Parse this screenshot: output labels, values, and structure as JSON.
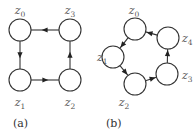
{
  "diagrams": [
    {
      "caption": "(a)",
      "nodes": [
        {
          "id": "z0",
          "base": "z",
          "sub": "0",
          "cx": 20,
          "cy": 30,
          "lx": 20,
          "ly": 14,
          "anchor": "middle"
        },
        {
          "id": "z1",
          "base": "z",
          "sub": "1",
          "cx": 20,
          "cy": 80,
          "lx": 20,
          "ly": 106,
          "anchor": "middle"
        },
        {
          "id": "z2",
          "base": "z",
          "sub": "2",
          "cx": 70,
          "cy": 80,
          "lx": 70,
          "ly": 106,
          "anchor": "middle"
        },
        {
          "id": "z3",
          "base": "z",
          "sub": "3",
          "cx": 70,
          "cy": 30,
          "lx": 70,
          "ly": 14,
          "anchor": "middle"
        }
      ],
      "edges": [
        {
          "from": "z3",
          "to": "z0"
        },
        {
          "from": "z0",
          "to": "z1"
        },
        {
          "from": "z1",
          "to": "z2"
        },
        {
          "from": "z2",
          "to": "z3"
        }
      ]
    },
    {
      "caption": "(b)",
      "nodes": [
        {
          "id": "z0",
          "base": "z",
          "sub": "0",
          "cx": 135,
          "cy": 29,
          "lx": 134,
          "ly": 14,
          "anchor": "middle"
        },
        {
          "id": "z1",
          "base": "z",
          "sub": "1",
          "cx": 113,
          "cy": 57,
          "lx": 97,
          "ly": 61,
          "anchor": "start"
        },
        {
          "id": "z2",
          "base": "z",
          "sub": "2",
          "cx": 135,
          "cy": 84,
          "lx": 124,
          "ly": 106,
          "anchor": "middle"
        },
        {
          "id": "z3",
          "base": "z",
          "sub": "3",
          "cx": 167,
          "cy": 74,
          "lx": 182,
          "ly": 79,
          "anchor": "start"
        },
        {
          "id": "z4",
          "base": "z",
          "sub": "4",
          "cx": 168,
          "cy": 38,
          "lx": 182,
          "ly": 42,
          "anchor": "start"
        }
      ],
      "edges": [
        {
          "from": "z4",
          "to": "z0"
        },
        {
          "from": "z0",
          "to": "z1"
        },
        {
          "from": "z1",
          "to": "z2"
        },
        {
          "from": "z2",
          "to": "z3"
        },
        {
          "from": "z3",
          "to": "z4"
        }
      ]
    }
  ],
  "style": {
    "node_radius": 11,
    "stroke": "#333333"
  }
}
